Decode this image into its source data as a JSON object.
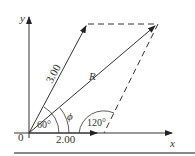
{
  "diagram": {
    "type": "vector-addition-parallelogram",
    "axes": {
      "x_label": "x",
      "y_label": "y",
      "origin_label": "0"
    },
    "vectors": [
      {
        "name": "A",
        "magnitude_label": "2.00",
        "angle_deg": 0
      },
      {
        "name": "B",
        "magnitude_label": "3.00",
        "angle_deg": 60
      },
      {
        "name": "R",
        "label": "R",
        "description": "resultant"
      }
    ],
    "angles": {
      "between_vectors": "60°",
      "resultant_angle": "ϕ",
      "interior_angle": "120°"
    },
    "colors": {
      "line": "#333333",
      "background": "#ffffff",
      "rule": "#888888"
    }
  }
}
